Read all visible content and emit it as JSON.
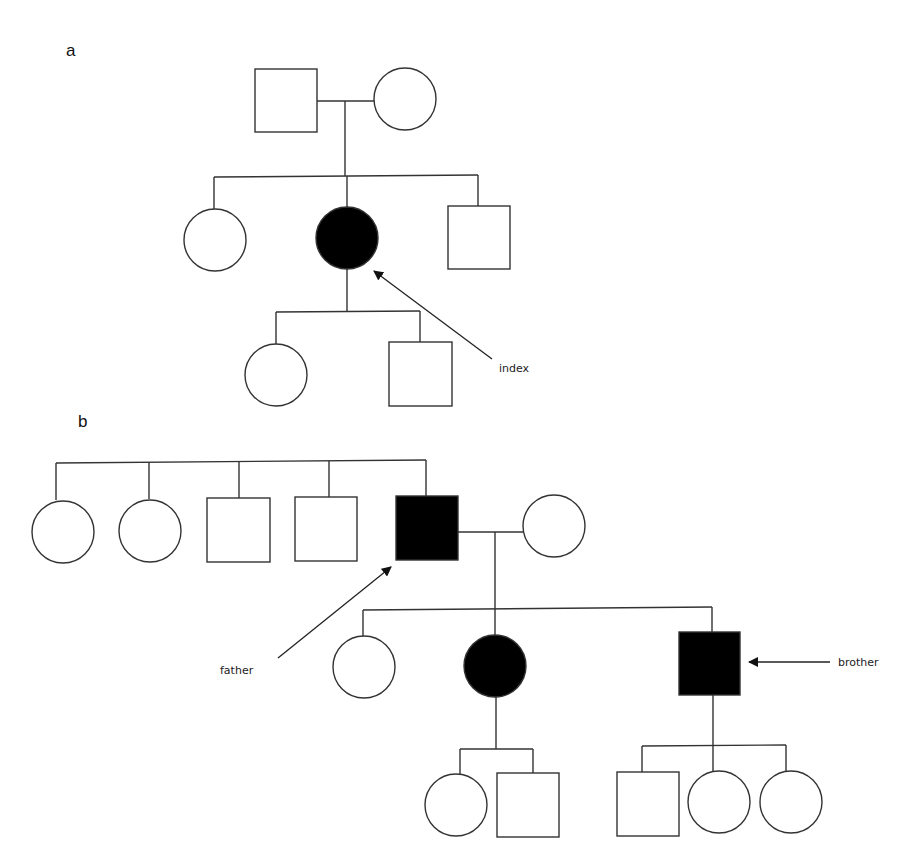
{
  "figure": {
    "type": "pedigree",
    "panels": [
      {
        "label": "a",
        "annotations": [
          {
            "text": "index",
            "points_to": "affected female (generation II)"
          }
        ],
        "legend": {
          "affected_fill": "#000000",
          "unaffected_fill": "#ffffff"
        }
      },
      {
        "label": "b",
        "annotations": [
          {
            "text": "father",
            "points_to": "affected male (generation I)"
          },
          {
            "text": "brother",
            "points_to": "affected male (generation II)"
          }
        ]
      }
    ]
  },
  "panel_a": {
    "label": "a",
    "index_label": "index",
    "generation_I": [
      {
        "sex": "male",
        "affected": false
      },
      {
        "sex": "female",
        "affected": false
      }
    ],
    "generation_II": [
      {
        "sex": "female",
        "affected": false
      },
      {
        "sex": "female",
        "affected": true,
        "proband": true
      },
      {
        "sex": "male",
        "affected": false
      }
    ],
    "generation_III": [
      {
        "sex": "female",
        "affected": false
      },
      {
        "sex": "male",
        "affected": false
      }
    ]
  },
  "panel_b": {
    "label": "b",
    "father_label": "father",
    "brother_label": "brother",
    "generation_I": [
      {
        "sex": "female",
        "affected": false
      },
      {
        "sex": "female",
        "affected": false
      },
      {
        "sex": "male",
        "affected": false
      },
      {
        "sex": "male",
        "affected": false
      },
      {
        "sex": "male",
        "affected": true,
        "annotation": "father"
      },
      {
        "sex": "female",
        "affected": false,
        "spouse": true
      }
    ],
    "generation_II": [
      {
        "sex": "female",
        "affected": false
      },
      {
        "sex": "female",
        "affected": true
      },
      {
        "sex": "male",
        "affected": true,
        "annotation": "brother"
      }
    ],
    "generation_III": [
      {
        "sex": "female",
        "affected": false,
        "parent": "affected female"
      },
      {
        "sex": "male",
        "affected": false,
        "parent": "affected female"
      },
      {
        "sex": "male",
        "affected": false,
        "parent": "brother"
      },
      {
        "sex": "female",
        "affected": false,
        "parent": "brother"
      },
      {
        "sex": "female",
        "affected": false,
        "parent": "brother"
      }
    ]
  },
  "colors": {
    "line": "#333333",
    "affected": "#000000",
    "unaffected": "#ffffff"
  }
}
